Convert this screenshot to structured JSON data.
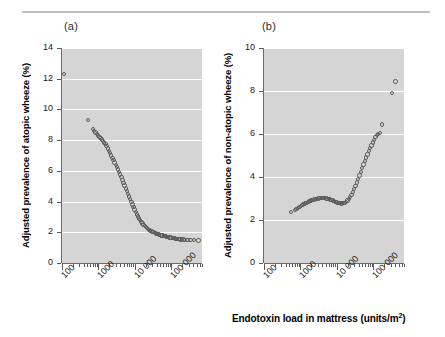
{
  "figure": {
    "panels": [
      {
        "id": "a",
        "label": "(a)",
        "ylabel": "Adjusted prevalence of atopic wheeze (%)"
      },
      {
        "id": "b",
        "label": "(b)",
        "ylabel": "Adjusted prevalence of non-atopic wheeze (%)"
      }
    ],
    "xlabel_text": "Endotoxin load in mattress (units/m",
    "xlabel_sup": "2",
    "xlabel_tail": ")",
    "xlabel_full": "Endotoxin load in mattress (units/m2)"
  },
  "chart_data": [
    {
      "type": "scatter",
      "panel": "a",
      "title": "(a)",
      "xlabel": "Endotoxin load in mattress (units/m2)",
      "ylabel": "Adjusted prevalence of atopic wheeze (%)",
      "xscale": "log",
      "xlim": [
        100,
        700000
      ],
      "ylim": [
        0,
        14
      ],
      "yticks": [
        0,
        2,
        4,
        6,
        8,
        10,
        12,
        14
      ],
      "ytick_labels": [
        "0",
        "2",
        "4",
        "6",
        "8",
        "10",
        "12",
        "14"
      ],
      "xticks": [
        100,
        1000,
        10000,
        100000
      ],
      "xtick_labels": [
        "100",
        "1000",
        "10 000",
        "100 000"
      ],
      "grid": "horizontal-white",
      "plot_bg": "#d5d5d5",
      "marker": "open-circle",
      "marker_color": "#5d5d5d",
      "points": [
        {
          "x": 112,
          "y": 12.3
        },
        {
          "x": 520,
          "y": 9.32
        },
        {
          "x": 700,
          "y": 8.72
        },
        {
          "x": 760,
          "y": 8.6
        },
        {
          "x": 830,
          "y": 8.5
        },
        {
          "x": 900,
          "y": 8.38
        },
        {
          "x": 980,
          "y": 8.3
        },
        {
          "x": 1060,
          "y": 8.22
        },
        {
          "x": 1150,
          "y": 8.15
        },
        {
          "x": 1250,
          "y": 8.05
        },
        {
          "x": 1340,
          "y": 7.95
        },
        {
          "x": 1450,
          "y": 7.85
        },
        {
          "x": 1560,
          "y": 7.74
        },
        {
          "x": 1680,
          "y": 7.6
        },
        {
          "x": 1800,
          "y": 7.45
        },
        {
          "x": 1950,
          "y": 7.3
        },
        {
          "x": 2100,
          "y": 7.15
        },
        {
          "x": 2250,
          "y": 7.0
        },
        {
          "x": 2420,
          "y": 6.85
        },
        {
          "x": 2600,
          "y": 6.7
        },
        {
          "x": 2790,
          "y": 6.55
        },
        {
          "x": 3000,
          "y": 6.4
        },
        {
          "x": 3220,
          "y": 6.24
        },
        {
          "x": 3450,
          "y": 6.08
        },
        {
          "x": 3700,
          "y": 5.92
        },
        {
          "x": 3970,
          "y": 5.75
        },
        {
          "x": 4260,
          "y": 5.58
        },
        {
          "x": 4570,
          "y": 5.4
        },
        {
          "x": 4900,
          "y": 5.22
        },
        {
          "x": 5260,
          "y": 5.04
        },
        {
          "x": 5640,
          "y": 4.86
        },
        {
          "x": 6050,
          "y": 4.68
        },
        {
          "x": 6490,
          "y": 4.5
        },
        {
          "x": 6960,
          "y": 4.33
        },
        {
          "x": 7470,
          "y": 4.15
        },
        {
          "x": 8010,
          "y": 3.98
        },
        {
          "x": 8600,
          "y": 3.8
        },
        {
          "x": 9220,
          "y": 3.64
        },
        {
          "x": 9900,
          "y": 3.48
        },
        {
          "x": 10600,
          "y": 3.32
        },
        {
          "x": 11400,
          "y": 3.17
        },
        {
          "x": 12200,
          "y": 3.03
        },
        {
          "x": 13100,
          "y": 2.9
        },
        {
          "x": 14100,
          "y": 2.78
        },
        {
          "x": 15100,
          "y": 2.67
        },
        {
          "x": 16200,
          "y": 2.57
        },
        {
          "x": 17400,
          "y": 2.48
        },
        {
          "x": 18700,
          "y": 2.4
        },
        {
          "x": 20000,
          "y": 2.33
        },
        {
          "x": 21500,
          "y": 2.27
        },
        {
          "x": 23100,
          "y": 2.21
        },
        {
          "x": 24800,
          "y": 2.16
        },
        {
          "x": 26600,
          "y": 2.11
        },
        {
          "x": 28500,
          "y": 2.07
        },
        {
          "x": 30600,
          "y": 2.03
        },
        {
          "x": 32900,
          "y": 2.0
        },
        {
          "x": 35300,
          "y": 1.96
        },
        {
          "x": 37900,
          "y": 1.93
        },
        {
          "x": 40700,
          "y": 1.9
        },
        {
          "x": 43700,
          "y": 1.88
        },
        {
          "x": 46900,
          "y": 1.85
        },
        {
          "x": 50300,
          "y": 1.83
        },
        {
          "x": 54000,
          "y": 1.8
        },
        {
          "x": 58000,
          "y": 1.78
        },
        {
          "x": 62200,
          "y": 1.76
        },
        {
          "x": 66800,
          "y": 1.74
        },
        {
          "x": 71700,
          "y": 1.72
        },
        {
          "x": 77000,
          "y": 1.7
        },
        {
          "x": 82700,
          "y": 1.69
        },
        {
          "x": 88800,
          "y": 1.67
        },
        {
          "x": 95300,
          "y": 1.65
        },
        {
          "x": 102000,
          "y": 1.64
        },
        {
          "x": 110000,
          "y": 1.62
        },
        {
          "x": 118000,
          "y": 1.61
        },
        {
          "x": 127000,
          "y": 1.6
        },
        {
          "x": 136000,
          "y": 1.58
        },
        {
          "x": 146000,
          "y": 1.57
        },
        {
          "x": 157000,
          "y": 1.56
        },
        {
          "x": 169000,
          "y": 1.55
        },
        {
          "x": 182000,
          "y": 1.54
        },
        {
          "x": 196000,
          "y": 1.53
        },
        {
          "x": 215000,
          "y": 1.52
        },
        {
          "x": 240000,
          "y": 1.51
        },
        {
          "x": 280000,
          "y": 1.5
        },
        {
          "x": 340000,
          "y": 1.49
        },
        {
          "x": 430000,
          "y": 1.48
        },
        {
          "x": 560000,
          "y": 1.47
        }
      ]
    },
    {
      "type": "scatter",
      "panel": "b",
      "title": "(b)",
      "xlabel": "Endotoxin load in mattress (units/m2)",
      "ylabel": "Adjusted prevalence of non-atopic wheeze (%)",
      "xscale": "log",
      "xlim": [
        100,
        700000
      ],
      "ylim": [
        0,
        10
      ],
      "yticks": [
        0,
        2,
        4,
        6,
        8,
        10
      ],
      "ytick_labels": [
        "0",
        "2",
        "4",
        "6",
        "8",
        "10"
      ],
      "xticks": [
        100,
        1000,
        10000,
        100000
      ],
      "xtick_labels": [
        "100",
        "1000",
        "10 000",
        "100 000"
      ],
      "grid": "horizontal-white",
      "plot_bg": "#d5d5d5",
      "marker": "open-circle",
      "marker_color": "#5d5d5d",
      "points": [
        {
          "x": 560,
          "y": 2.36
        },
        {
          "x": 700,
          "y": 2.46
        },
        {
          "x": 790,
          "y": 2.52
        },
        {
          "x": 870,
          "y": 2.57
        },
        {
          "x": 950,
          "y": 2.61
        },
        {
          "x": 1040,
          "y": 2.65
        },
        {
          "x": 1130,
          "y": 2.69
        },
        {
          "x": 1230,
          "y": 2.73
        },
        {
          "x": 1340,
          "y": 2.77
        },
        {
          "x": 1460,
          "y": 2.8
        },
        {
          "x": 1590,
          "y": 2.83
        },
        {
          "x": 1730,
          "y": 2.86
        },
        {
          "x": 1880,
          "y": 2.89
        },
        {
          "x": 2040,
          "y": 2.92
        },
        {
          "x": 2220,
          "y": 2.94
        },
        {
          "x": 2420,
          "y": 2.96
        },
        {
          "x": 2630,
          "y": 2.98
        },
        {
          "x": 2860,
          "y": 2.99
        },
        {
          "x": 3110,
          "y": 3.0
        },
        {
          "x": 3380,
          "y": 3.01
        },
        {
          "x": 3680,
          "y": 3.02
        },
        {
          "x": 4000,
          "y": 3.02
        },
        {
          "x": 4350,
          "y": 3.02
        },
        {
          "x": 4730,
          "y": 3.01
        },
        {
          "x": 5150,
          "y": 3.0
        },
        {
          "x": 5600,
          "y": 2.99
        },
        {
          "x": 6090,
          "y": 2.97
        },
        {
          "x": 6620,
          "y": 2.95
        },
        {
          "x": 7200,
          "y": 2.93
        },
        {
          "x": 7830,
          "y": 2.9
        },
        {
          "x": 8520,
          "y": 2.87
        },
        {
          "x": 9270,
          "y": 2.85
        },
        {
          "x": 10100,
          "y": 2.82
        },
        {
          "x": 11000,
          "y": 2.8
        },
        {
          "x": 11900,
          "y": 2.78
        },
        {
          "x": 13000,
          "y": 2.77
        },
        {
          "x": 14100,
          "y": 2.77
        },
        {
          "x": 15300,
          "y": 2.78
        },
        {
          "x": 16700,
          "y": 2.8
        },
        {
          "x": 18100,
          "y": 2.84
        },
        {
          "x": 19700,
          "y": 2.9
        },
        {
          "x": 21400,
          "y": 2.97
        },
        {
          "x": 23300,
          "y": 3.06
        },
        {
          "x": 25300,
          "y": 3.17
        },
        {
          "x": 27600,
          "y": 3.29
        },
        {
          "x": 30000,
          "y": 3.43
        },
        {
          "x": 32600,
          "y": 3.58
        },
        {
          "x": 35500,
          "y": 3.74
        },
        {
          "x": 38600,
          "y": 3.9
        },
        {
          "x": 42000,
          "y": 4.07
        },
        {
          "x": 45700,
          "y": 4.24
        },
        {
          "x": 49700,
          "y": 4.41
        },
        {
          "x": 54000,
          "y": 4.58
        },
        {
          "x": 58800,
          "y": 4.74
        },
        {
          "x": 63900,
          "y": 4.9
        },
        {
          "x": 69500,
          "y": 5.05
        },
        {
          "x": 75600,
          "y": 5.2
        },
        {
          "x": 82200,
          "y": 5.34
        },
        {
          "x": 89400,
          "y": 5.47
        },
        {
          "x": 97300,
          "y": 5.6
        },
        {
          "x": 106000,
          "y": 5.72
        },
        {
          "x": 115000,
          "y": 5.85
        },
        {
          "x": 125000,
          "y": 5.95
        },
        {
          "x": 136000,
          "y": 6.0
        },
        {
          "x": 152000,
          "y": 6.05
        },
        {
          "x": 172000,
          "y": 6.45
        },
        {
          "x": 330000,
          "y": 7.92
        },
        {
          "x": 410000,
          "y": 8.45
        }
      ]
    }
  ]
}
